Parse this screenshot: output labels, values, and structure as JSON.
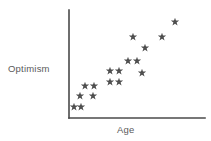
{
  "figure": {
    "background": "#ffffff",
    "width": 211,
    "height": 141
  },
  "axes": {
    "x_label": "Age",
    "y_label": "Optimism",
    "axis_color": "#4a4a4a",
    "y_axis": {
      "x": 69,
      "y_top": 10,
      "y_bottom": 118
    },
    "x_axis": {
      "y": 118,
      "x_left": 69,
      "x_right": 205
    }
  },
  "marker": {
    "symbol": "star",
    "color": "#4f4f4f",
    "size": 4.6
  },
  "chart_data": {
    "type": "scatter",
    "title": "",
    "xlabel": "Age",
    "ylabel": "Optimism",
    "xlim": [
      0,
      100
    ],
    "ylim": [
      0,
      100
    ],
    "grid": false,
    "legend": null,
    "axis_ticks": {
      "x": [],
      "y": []
    },
    "n_points": 16,
    "points": [
      {
        "x": 74,
        "y": 107
      },
      {
        "x": 81,
        "y": 107
      },
      {
        "x": 80,
        "y": 96
      },
      {
        "x": 93,
        "y": 96
      },
      {
        "x": 85,
        "y": 86
      },
      {
        "x": 94,
        "y": 86
      },
      {
        "x": 110,
        "y": 82
      },
      {
        "x": 119,
        "y": 82
      },
      {
        "x": 110,
        "y": 71
      },
      {
        "x": 119,
        "y": 71
      },
      {
        "x": 142,
        "y": 73
      },
      {
        "x": 128,
        "y": 61
      },
      {
        "x": 137,
        "y": 61
      },
      {
        "x": 145,
        "y": 48
      },
      {
        "x": 133,
        "y": 37
      },
      {
        "x": 162,
        "y": 37
      },
      {
        "x": 175,
        "y": 22
      }
    ]
  }
}
